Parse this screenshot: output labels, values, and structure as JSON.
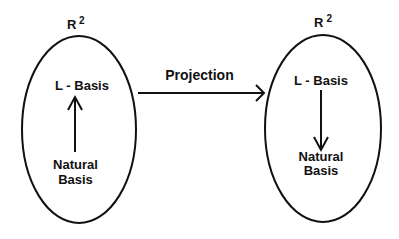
{
  "diagram": {
    "type": "mapping-diagram",
    "left_space": {
      "label": "R",
      "superscript": "2",
      "top_node": "L - Basis",
      "bottom_node_line1": "Natural",
      "bottom_node_line2": "Basis",
      "inner_arrow_direction": "up (Natural Basis → L - Basis)"
    },
    "connector": {
      "label": "Projection",
      "direction": "left-to-right"
    },
    "right_space": {
      "label": "R",
      "superscript": "2",
      "top_node": "L - Basis",
      "bottom_node_line1": "Natural",
      "bottom_node_line2": "Basis",
      "inner_arrow_direction": "down (L - Basis → Natural Basis)"
    },
    "colors": {
      "background": "#ffffff",
      "stroke": "#111111",
      "text": "#111111"
    }
  }
}
